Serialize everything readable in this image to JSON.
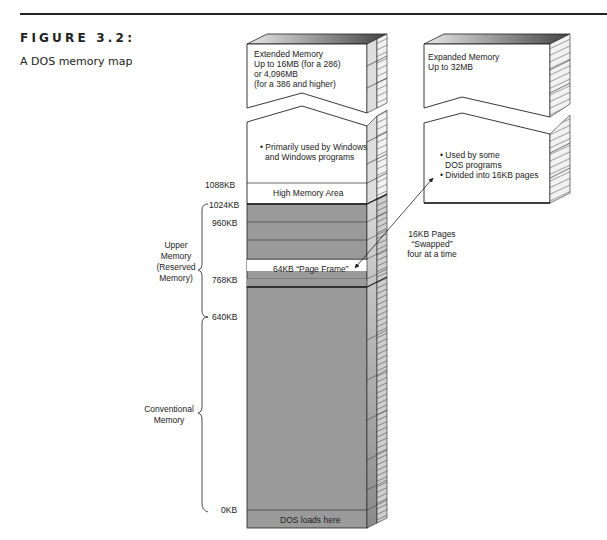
{
  "figure": {
    "label": "FIGURE 3.2:",
    "caption": "A DOS memory map"
  },
  "extended_memory": {
    "lines": [
      "Extended Memory",
      "Up to 16MB (for a 286)",
      "or 4,096MB",
      "(for a 386 and higher)"
    ],
    "usage": [
      "• Primarily used by Windows",
      "and Windows programs"
    ],
    "hma_label": "High Memory Area"
  },
  "expanded_memory": {
    "lines": [
      "Expanded Memory",
      "Up to 32MB"
    ],
    "bullets": [
      "• Used by some",
      "DOS programs",
      "• Divided into 16KB pages"
    ]
  },
  "address_labels": {
    "kb1088": "1088KB",
    "kb1024": "1024KB",
    "kb960": "960KB",
    "kb768": "768KB",
    "kb640": "640KB",
    "kb0": "0KB"
  },
  "regions": {
    "upper": [
      "Upper",
      "Memory",
      "(Reserved",
      "Memory)"
    ],
    "conventional": [
      "Conventional",
      "Memory"
    ]
  },
  "blocks": {
    "page_frame": "64KB “Page Frame”",
    "dos_loads": "DOS loads here"
  },
  "swap_note": [
    "16KB Pages",
    "“Swapped”",
    "four at a time"
  ],
  "colors": {
    "gray_block": "#9a9a9a",
    "side_light": "#d4d4d4",
    "side_dark": "#8a8a8a",
    "line": "#222222"
  }
}
